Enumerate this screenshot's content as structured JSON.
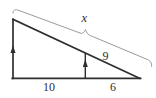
{
  "figure": {
    "labels": {
      "hypotenuse_total": "x",
      "hypotenuse_right_segment": "9",
      "base_left_segment": "10",
      "base_right_segment": "6"
    },
    "icons": {
      "parallel_mark": "up-arrow"
    },
    "colors": {
      "line": "#2e2e2e",
      "brace": "#8f8f8f",
      "text": "#2e2e2e",
      "background": "#ffffff"
    }
  }
}
